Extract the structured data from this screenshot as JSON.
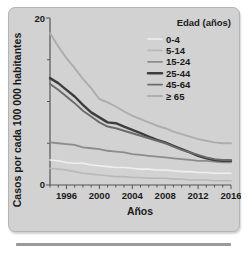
{
  "figure": {
    "background_color": "#d2d2d2",
    "frame_color": "#b4b4b4",
    "rule_color": "#9a9a9a"
  },
  "chart_data": {
    "type": "line",
    "title": "",
    "xlabel": "Años",
    "ylabel": "Casos por cada 100 000 habitantes",
    "xlim": [
      1994,
      2016
    ],
    "ylim": [
      0,
      20
    ],
    "ytick_labels": [
      "0",
      "20"
    ],
    "ytick_values": [
      0,
      20
    ],
    "yminor_ticks": [
      5,
      10,
      15
    ],
    "xtick_labels": [
      "1996",
      "2000",
      "2004",
      "2008",
      "2012",
      "2016"
    ],
    "xtick_values": [
      1996,
      2000,
      2004,
      2008,
      2012,
      2016
    ],
    "xminor_ticks": [
      1994,
      1995,
      1997,
      1998,
      1999,
      2001,
      2002,
      2003,
      2005,
      2006,
      2007,
      2009,
      2010,
      2011,
      2013,
      2014,
      2015
    ],
    "grid": false,
    "legend_position": "top-right",
    "legend_title": "Edad (años)",
    "x": [
      1994,
      1995,
      1996,
      1997,
      1998,
      1999,
      2000,
      2001,
      2002,
      2003,
      2004,
      2005,
      2006,
      2007,
      2008,
      2009,
      2010,
      2011,
      2012,
      2013,
      2014,
      2015,
      2016
    ],
    "series": [
      {
        "name": "0-4",
        "color": "#efefef",
        "width": 1.6,
        "values": [
          3.0,
          2.9,
          2.7,
          2.6,
          2.6,
          2.4,
          2.3,
          2.2,
          2.1,
          2.1,
          2.0,
          1.9,
          1.9,
          1.8,
          1.8,
          1.7,
          1.6,
          1.6,
          1.5,
          1.5,
          1.4,
          1.4,
          1.4
        ]
      },
      {
        "name": "5-14",
        "color": "#b8b8b8",
        "width": 1.6,
        "values": [
          2.0,
          1.9,
          1.8,
          1.6,
          1.4,
          1.3,
          1.2,
          1.1,
          1.0,
          1.0,
          0.9,
          0.9,
          0.8,
          0.8,
          0.8,
          0.7,
          0.7,
          0.6,
          0.6,
          0.6,
          0.5,
          0.5,
          0.5
        ]
      },
      {
        "name": "15-24",
        "color": "#8c8c8c",
        "width": 1.8,
        "values": [
          5.1,
          5.0,
          4.9,
          4.8,
          4.5,
          4.4,
          4.3,
          4.1,
          4.0,
          3.9,
          3.7,
          3.6,
          3.5,
          3.4,
          3.3,
          3.2,
          3.1,
          3.0,
          2.9,
          2.9,
          2.8,
          2.7,
          2.7
        ]
      },
      {
        "name": "25-44",
        "color": "#3d3d3d",
        "width": 2.4,
        "values": [
          12.8,
          12.2,
          11.4,
          10.6,
          9.6,
          8.7,
          8.1,
          7.5,
          7.4,
          7.0,
          6.6,
          6.2,
          5.8,
          5.4,
          5.1,
          4.7,
          4.3,
          3.9,
          3.5,
          3.2,
          3.0,
          2.9,
          2.9
        ]
      },
      {
        "name": "45-64",
        "color": "#6b6b6b",
        "width": 1.9,
        "values": [
          12.1,
          11.4,
          10.6,
          9.8,
          8.9,
          8.2,
          7.5,
          7.0,
          6.8,
          6.5,
          6.2,
          5.9,
          5.6,
          5.3,
          5.0,
          4.6,
          4.2,
          3.9,
          3.6,
          3.3,
          3.1,
          3.0,
          3.0
        ]
      },
      {
        "name": "≥ 65",
        "color": "#adadad",
        "width": 1.9,
        "values": [
          18.2,
          16.6,
          15.2,
          14.0,
          12.7,
          11.6,
          10.3,
          9.9,
          9.4,
          8.8,
          8.3,
          7.9,
          7.5,
          7.1,
          6.8,
          6.4,
          6.1,
          5.8,
          5.5,
          5.3,
          5.1,
          5.0,
          5.0
        ]
      }
    ]
  }
}
